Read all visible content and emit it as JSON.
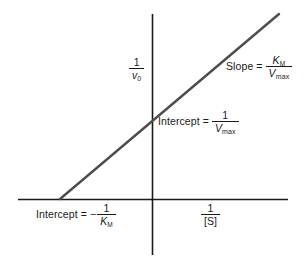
{
  "chart_data": {
    "type": "line",
    "title": "",
    "subtitle": "",
    "xlabel": "1/[S]",
    "ylabel": "1/v0",
    "grid": false,
    "legend": null,
    "axes": {
      "x_axis_y_px": 199,
      "y_axis_x_px": 152,
      "x_axis_from_px": 18,
      "x_axis_to_px": 288,
      "y_axis_from_px": 14,
      "y_axis_to_px": 255,
      "origin_px": [
        152,
        199
      ]
    },
    "series": [
      {
        "name": "Lineweaver-Burk line",
        "points_px": [
          [
            60,
            199
          ],
          [
            279,
            14
          ]
        ],
        "x_intercept_label": "-1/KM",
        "y_intercept_label": "1/Vmax",
        "slope_label": "KM/Vmax",
        "color": "#4d4d4d"
      }
    ],
    "annotations": [
      {
        "id": "slope",
        "text": "Slope = KM/Vmax"
      },
      {
        "id": "y-intercept",
        "text": "Intercept = 1/Vmax"
      },
      {
        "id": "x-intercept",
        "text": "Intercept = -1/KM"
      }
    ]
  },
  "labels": {
    "y_axis": {
      "numerator": "1",
      "denominator_symbol": "v",
      "denominator_subscript": "0"
    },
    "x_axis": {
      "numerator": "1",
      "denominator": "[S]"
    },
    "slope": {
      "text": "Slope",
      "equals": "=",
      "numerator_symbol": "K",
      "numerator_subscript": "M",
      "denominator_symbol": "V",
      "denominator_subscript": "max"
    },
    "intercept_vmax": {
      "text": "Intercept",
      "equals": "=",
      "numerator": "1",
      "denominator_symbol": "V",
      "denominator_subscript": "max"
    },
    "intercept_km": {
      "text": "Intercept",
      "equals": "=",
      "minus": "−",
      "numerator": "1",
      "denominator_symbol": "K",
      "denominator_subscript": "M"
    }
  },
  "colors": {
    "background": "#ffffff",
    "axis": "#1a1a1a",
    "data_line": "#4d4d4d",
    "text": "#1a1a1a"
  }
}
